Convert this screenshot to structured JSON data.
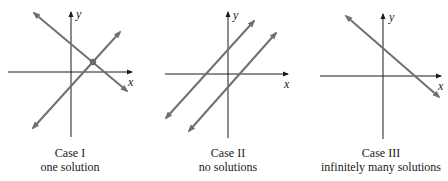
{
  "colors": {
    "axis": "#1a1a1a",
    "line": "#707070",
    "point": "#6a6a6a"
  },
  "panels": [
    {
      "id": "case-1",
      "title": "Case I",
      "subtitle": "one solution",
      "axis_labels": {
        "x": "x",
        "y": "y"
      },
      "lines": 2,
      "intersection": "single point"
    },
    {
      "id": "case-2",
      "title": "Case II",
      "subtitle": "no solutions",
      "axis_labels": {
        "x": "x",
        "y": "y"
      },
      "lines": 2,
      "intersection": "parallel, none"
    },
    {
      "id": "case-3",
      "title": "Case III",
      "subtitle": "infinitely many solutions",
      "axis_labels": {
        "x": "x",
        "y": "y"
      },
      "lines": 1,
      "intersection": "coincident lines"
    }
  ]
}
